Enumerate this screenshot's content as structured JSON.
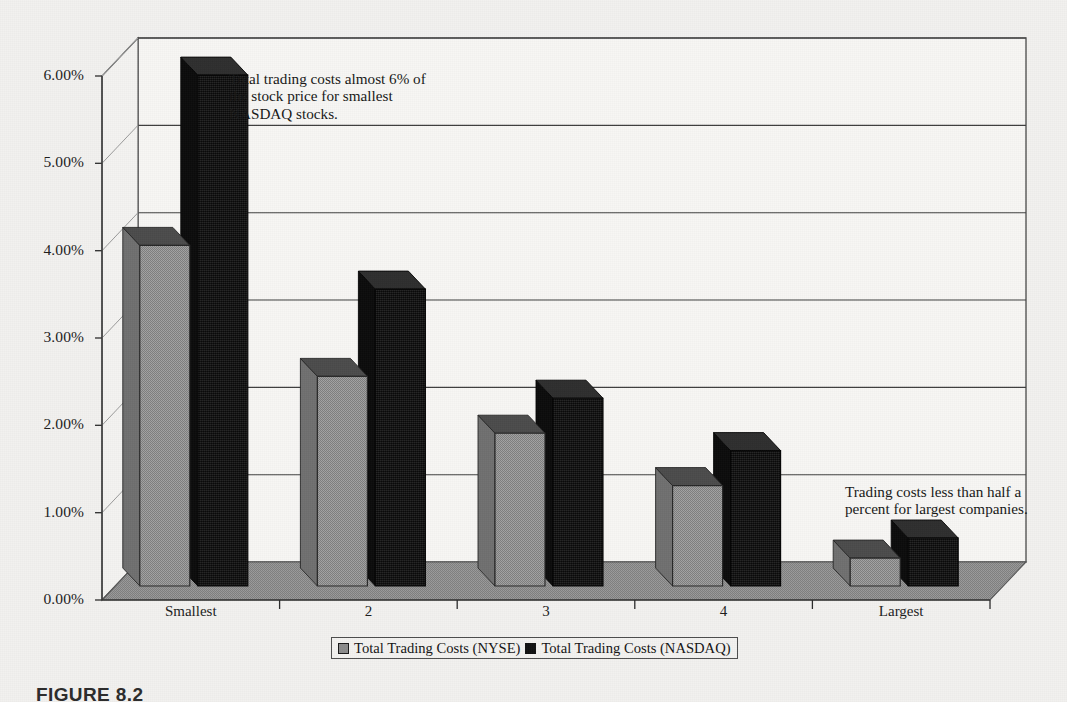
{
  "chart_data": {
    "type": "bar",
    "title": "",
    "subtitle": "",
    "xlabel": "",
    "ylabel": "",
    "categories": [
      "Smallest",
      "2",
      "3",
      "4",
      "Largest"
    ],
    "series": [
      {
        "name": "Total Trading Costs (NYSE)",
        "values": [
          3.9,
          2.4,
          1.75,
          1.15,
          0.32
        ],
        "color": "#8c8c8c"
      },
      {
        "name": "Total Trading Costs (NASDAQ)",
        "values": [
          5.85,
          3.4,
          2.15,
          1.55,
          0.55
        ],
        "color": "#121212"
      }
    ],
    "ylim": [
      0,
      6
    ],
    "ytick_values": [
      0,
      1,
      2,
      3,
      4,
      5,
      6
    ],
    "ytick_labels": [
      "0.00%",
      "1.00%",
      "2.00%",
      "3.00%",
      "4.00%",
      "5.00%",
      "6.00%"
    ],
    "grid": true,
    "legend_position": "bottom",
    "style": "3d-column",
    "annotations": [
      {
        "id": "annotation-smallest",
        "text": "Total trading costs almost 6% of the stock price for smallest NASDAQ stocks."
      },
      {
        "id": "annotation-largest",
        "text": "Trading costs less than half a percent for largest companies."
      }
    ]
  },
  "legend": {
    "entries": [
      {
        "label": "Total Trading Costs (NYSE)",
        "swatch": "gray-square-icon"
      },
      {
        "label": "Total Trading Costs (NASDAQ)",
        "swatch": "black-square-icon"
      }
    ]
  },
  "caption": {
    "text": "FIGURE 8.2"
  },
  "colors": {
    "page_background": "#f2f1ef",
    "plot_background": "#f7f6f4",
    "floor": "#8e8e8e",
    "nyse_front": "#9a9a9a",
    "nyse_top": "#4b4b4b",
    "nyse_side": "#6f6f6f",
    "nasdaq_front": "#161616",
    "nasdaq_top": "#2e2e2e",
    "nasdaq_side": "#0b0b0b",
    "frame_line": "#555555",
    "text": "#1c1c1c"
  }
}
